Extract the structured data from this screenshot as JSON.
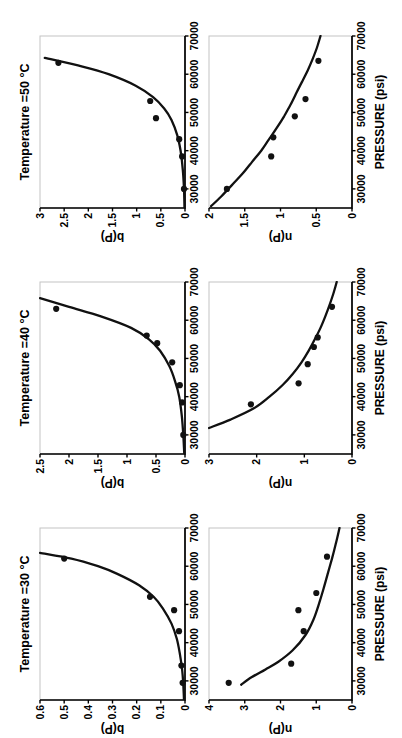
{
  "figure": {
    "background": "#ffffff",
    "text_color": "#000000",
    "frame_color": "#c4c4c4",
    "curve_color": "#111111",
    "point_color": "#111111"
  },
  "layout": {
    "grid": "2 rows x 3 columns",
    "rendered_rotation": "90deg counter-clockwise (landscape figure shown in portrait)",
    "columns": [
      "30 °C",
      "40 °C",
      "50 °C"
    ],
    "rows": [
      "b(P)",
      "n(P)"
    ]
  },
  "chart_data": [
    {
      "type": "scatter",
      "panel": "30C-b",
      "title": "Temperature =30 °C",
      "xlabel": "",
      "ylabel": "b(P)",
      "xlim": [
        25000,
        70000
      ],
      "xticks": [
        30000,
        40000,
        50000,
        60000,
        70000
      ],
      "ylim": [
        0,
        0.6
      ],
      "yticks": [
        0,
        0.1,
        0.2,
        0.3,
        0.4,
        0.5,
        0.6
      ],
      "grid": false,
      "points": [
        [
          29500,
          0.01
        ],
        [
          34000,
          0.015
        ],
        [
          43000,
          0.025
        ],
        [
          48500,
          0.045
        ],
        [
          52000,
          0.145
        ],
        [
          62000,
          0.5
        ]
      ],
      "fit_curve": [
        [
          25000,
          0.004
        ],
        [
          29000,
          0.007
        ],
        [
          33000,
          0.012
        ],
        [
          37000,
          0.021
        ],
        [
          41000,
          0.034
        ],
        [
          45000,
          0.056
        ],
        [
          49000,
          0.092
        ],
        [
          52000,
          0.13
        ],
        [
          55000,
          0.19
        ],
        [
          58000,
          0.28
        ],
        [
          60000,
          0.36
        ],
        [
          62000,
          0.47
        ],
        [
          63500,
          0.6
        ]
      ]
    },
    {
      "type": "scatter",
      "panel": "30C-n",
      "title": "",
      "xlabel": "PRESSURE (psi)",
      "ylabel": "n(P)",
      "xlim": [
        25000,
        70000
      ],
      "xticks": [
        30000,
        40000,
        50000,
        60000,
        70000
      ],
      "ylim": [
        0,
        4
      ],
      "yticks": [
        0,
        1,
        2,
        3,
        4
      ],
      "grid": false,
      "points": [
        [
          29500,
          3.45
        ],
        [
          34500,
          1.7
        ],
        [
          43000,
          1.35
        ],
        [
          48500,
          1.5
        ],
        [
          53000,
          1.0
        ],
        [
          62500,
          0.7
        ]
      ],
      "fit_curve": [
        [
          29000,
          3.1
        ],
        [
          31000,
          2.8
        ],
        [
          33000,
          2.42
        ],
        [
          35000,
          2.06
        ],
        [
          38000,
          1.66
        ],
        [
          42000,
          1.3
        ],
        [
          46000,
          1.08
        ],
        [
          50000,
          0.93
        ],
        [
          54000,
          0.8
        ],
        [
          58000,
          0.68
        ],
        [
          62000,
          0.56
        ],
        [
          66000,
          0.45
        ],
        [
          70000,
          0.35
        ]
      ]
    },
    {
      "type": "scatter",
      "panel": "40C-b",
      "title": "Temperature =40 °C",
      "xlabel": "",
      "ylabel": "b(P)",
      "xlim": [
        25000,
        70000
      ],
      "xticks": [
        30000,
        40000,
        50000,
        60000,
        70000
      ],
      "ylim": [
        0,
        2.5
      ],
      "yticks": [
        0,
        0.5,
        1,
        1.5,
        2,
        2.5
      ],
      "grid": false,
      "points": [
        [
          30000,
          0.03
        ],
        [
          38500,
          0.05
        ],
        [
          43000,
          0.09
        ],
        [
          49000,
          0.22
        ],
        [
          54000,
          0.48
        ],
        [
          56000,
          0.66
        ],
        [
          63000,
          2.22
        ]
      ],
      "fit_curve": [
        [
          25000,
          0.012
        ],
        [
          30000,
          0.03
        ],
        [
          35000,
          0.055
        ],
        [
          40000,
          0.1
        ],
        [
          44000,
          0.17
        ],
        [
          48000,
          0.27
        ],
        [
          52000,
          0.43
        ],
        [
          55000,
          0.62
        ],
        [
          58000,
          0.93
        ],
        [
          61000,
          1.45
        ],
        [
          63500,
          2.0
        ],
        [
          65800,
          2.5
        ]
      ]
    },
    {
      "type": "scatter",
      "panel": "40C-n",
      "title": "",
      "xlabel": "PRESSURE (psi)",
      "ylabel": "n(P)",
      "xlim": [
        25000,
        70000
      ],
      "xticks": [
        30000,
        40000,
        50000,
        60000,
        70000
      ],
      "ylim": [
        0,
        3
      ],
      "yticks": [
        0,
        1,
        2,
        3
      ],
      "grid": false,
      "points": [
        [
          38000,
          2.12
        ],
        [
          43500,
          1.12
        ],
        [
          48500,
          0.93
        ],
        [
          53000,
          0.8
        ],
        [
          55500,
          0.72
        ],
        [
          63500,
          0.42
        ]
      ],
      "fit_curve": [
        [
          31800,
          3.0
        ],
        [
          34000,
          2.55
        ],
        [
          37000,
          2.05
        ],
        [
          40000,
          1.73
        ],
        [
          43000,
          1.46
        ],
        [
          46000,
          1.24
        ],
        [
          49000,
          1.06
        ],
        [
          52000,
          0.91
        ],
        [
          55000,
          0.78
        ],
        [
          58000,
          0.66
        ],
        [
          61000,
          0.56
        ],
        [
          64000,
          0.47
        ],
        [
          67000,
          0.39
        ],
        [
          70000,
          0.32
        ]
      ]
    },
    {
      "type": "scatter",
      "panel": "50C-b",
      "title": "Temperature =50 °C",
      "xlabel": "",
      "ylabel": "b(P)",
      "xlim": [
        25000,
        70000
      ],
      "xticks": [
        30000,
        40000,
        50000,
        60000,
        70000
      ],
      "ylim": [
        0,
        3
      ],
      "yticks": [
        0,
        0.5,
        1,
        1.5,
        2,
        2.5,
        3
      ],
      "grid": false,
      "points": [
        [
          30000,
          0.02
        ],
        [
          38500,
          0.06
        ],
        [
          43000,
          0.12
        ],
        [
          48500,
          0.6
        ],
        [
          53000,
          0.72
        ],
        [
          63000,
          2.62
        ]
      ],
      "fit_curve": [
        [
          25000,
          0.01
        ],
        [
          30000,
          0.021
        ],
        [
          35000,
          0.045
        ],
        [
          40000,
          0.092
        ],
        [
          44000,
          0.16
        ],
        [
          48000,
          0.28
        ],
        [
          51000,
          0.43
        ],
        [
          54000,
          0.66
        ],
        [
          57000,
          1.02
        ],
        [
          60000,
          1.58
        ],
        [
          62000,
          2.12
        ],
        [
          64300,
          2.9
        ]
      ]
    },
    {
      "type": "scatter",
      "panel": "50C-n",
      "title": "",
      "xlabel": "PRESSURE (psi)",
      "ylabel": "n(P)",
      "xlim": [
        25000,
        70000
      ],
      "xticks": [
        30000,
        40000,
        50000,
        60000,
        70000
      ],
      "ylim": [
        0,
        2
      ],
      "yticks": [
        0,
        0.5,
        1,
        1.5,
        2
      ],
      "grid": false,
      "points": [
        [
          30000,
          1.75
        ],
        [
          38500,
          1.13
        ],
        [
          43500,
          1.1
        ],
        [
          49000,
          0.8
        ],
        [
          53500,
          0.65
        ],
        [
          63500,
          0.47
        ]
      ],
      "fit_curve": [
        [
          25500,
          1.97
        ],
        [
          28000,
          1.83
        ],
        [
          31000,
          1.68
        ],
        [
          34000,
          1.53
        ],
        [
          37000,
          1.4
        ],
        [
          40000,
          1.27
        ],
        [
          43000,
          1.16
        ],
        [
          46000,
          1.05
        ],
        [
          49000,
          0.95
        ],
        [
          52000,
          0.86
        ],
        [
          55000,
          0.78
        ],
        [
          58000,
          0.7
        ],
        [
          61000,
          0.62
        ],
        [
          64000,
          0.55
        ],
        [
          67000,
          0.49
        ],
        [
          70000,
          0.44
        ]
      ]
    }
  ]
}
